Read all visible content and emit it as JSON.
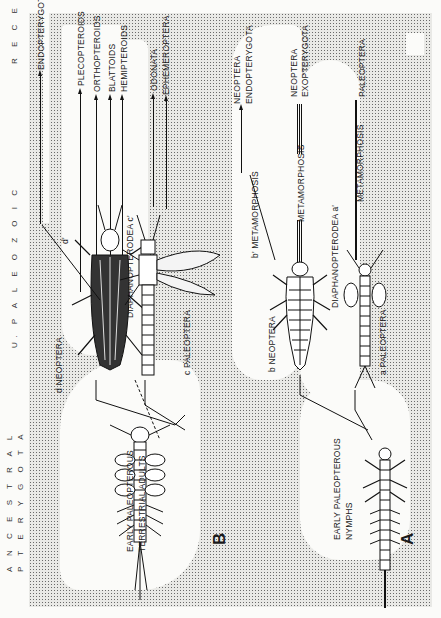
{
  "page": {
    "epochs": {
      "recent": "R E C E N T",
      "paleozoic": "U. P A L E O Z O I C",
      "ancestral_1": "A N C E S T R A L",
      "ancestral_2": "P T E R Y G O T A"
    }
  },
  "diagram": {
    "terminal_groups": [
      {
        "id": "endopterygota_d",
        "label": "ENDOPTERYGOTA"
      },
      {
        "id": "plecopteroids",
        "label": "PLECOPTEROIDS"
      },
      {
        "id": "orthopteroids",
        "label": "ORTHOPTEROIDS"
      },
      {
        "id": "blattoids",
        "label": "BLATTOIDS"
      },
      {
        "id": "hemipteroids",
        "label": "HEMIPTEROIDS"
      },
      {
        "id": "odonata",
        "label": "ODONATA"
      },
      {
        "id": "ephemeroptera",
        "label": "EPHEMEROPTERA"
      },
      {
        "id": "neoptera_endo_1",
        "label": "NEOPTERA"
      },
      {
        "id": "neoptera_endo_2",
        "label": "ENDOPTERYGOTA"
      },
      {
        "id": "neoptera_exo_1",
        "label": "NEOPTERA"
      },
      {
        "id": "neoptera_exo_2",
        "label": "EXOPTERYGOTA"
      },
      {
        "id": "paleoptera",
        "label": "PALEOPTERA"
      }
    ],
    "lineage_labels": {
      "d_neoptera": "d  NEOPTERA",
      "c_diaphanopterodea": "DIAPHANOPTERODEA  c'",
      "c_paleoptera": "c  PALEOPTERA",
      "b_neoptera": "b  NEOPTERA",
      "a_diaphanopterodea": "DIAPHANOPTERODEA  a'",
      "a_paleoptera": "a  PALEOPTERA",
      "b_metamorphosis": "b'  METAMORPHOSIS",
      "metamorphosis_2": "METAMORPHOSIS",
      "metamorphosis_3": "METAMORPHOSIS",
      "d_prime": "d'"
    },
    "nodes": {
      "adults_label_1": "EARLY PALEOPTEROUS",
      "adults_label_2": "TERRESTRIAL ADULTS",
      "adults_letter": "B",
      "nymphs_label_1": "EARLY PALEOPTEROUS",
      "nymphs_label_2": "NYMPHS",
      "nymphs_letter": "A",
      "branch_d": "d",
      "branch_c": "c",
      "branch_b": "b",
      "branch_a": "a"
    }
  }
}
